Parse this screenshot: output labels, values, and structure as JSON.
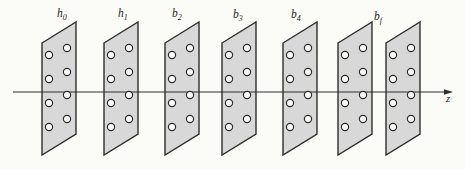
{
  "diagram": {
    "canvas": {
      "width": 465,
      "height": 169,
      "background": "#fbfbf8"
    },
    "axis": {
      "label": "z",
      "y": 92,
      "x_start": 13,
      "x_end": 445,
      "arrow_tip_x": 453,
      "label_x": 446,
      "label_y": 102,
      "color": "#2e2e2e"
    },
    "plate_style": {
      "fill": "#d8d8d8",
      "stroke": "#2e2e2e",
      "stroke_width": 1.4,
      "width": 34,
      "height": 112,
      "shear": 21,
      "top_left_y": 43,
      "hole_radius": 3.6,
      "hole_fill": "#fbfbf8",
      "hole_stroke": "#2e2e2e",
      "hole_stroke_width": 1.2,
      "holes": [
        [
          7,
          55
        ],
        [
          7,
          79
        ],
        [
          7,
          103
        ],
        [
          7,
          127
        ],
        [
          25,
          48
        ],
        [
          25,
          72
        ],
        [
          25,
          95
        ],
        [
          25,
          119
        ]
      ]
    },
    "label_style": {
      "font_size": 11.5,
      "sub_font_size": 8,
      "sub_dy": 2.5,
      "color": "#1e1e1e"
    },
    "plates": [
      {
        "x": 42,
        "label": {
          "base": "h",
          "sub": "0"
        },
        "label_x": 57,
        "label_y": 17
      },
      {
        "x": 104,
        "label": {
          "base": "h",
          "sub": "1"
        },
        "label_x": 118,
        "label_y": 17
      },
      {
        "x": 165,
        "label": {
          "base": "b",
          "sub": "2"
        },
        "label_x": 172,
        "label_y": 17
      },
      {
        "x": 222,
        "label": {
          "base": "b",
          "sub": "3"
        },
        "label_x": 233,
        "label_y": 18
      },
      {
        "x": 283,
        "label": {
          "base": "b",
          "sub": "4"
        },
        "label_x": 291,
        "label_y": 18
      },
      {
        "x": 338,
        "label": null
      },
      {
        "x": 386,
        "label": {
          "base": "b",
          "sub": "f"
        },
        "label_x": 374,
        "label_y": 20
      }
    ]
  }
}
